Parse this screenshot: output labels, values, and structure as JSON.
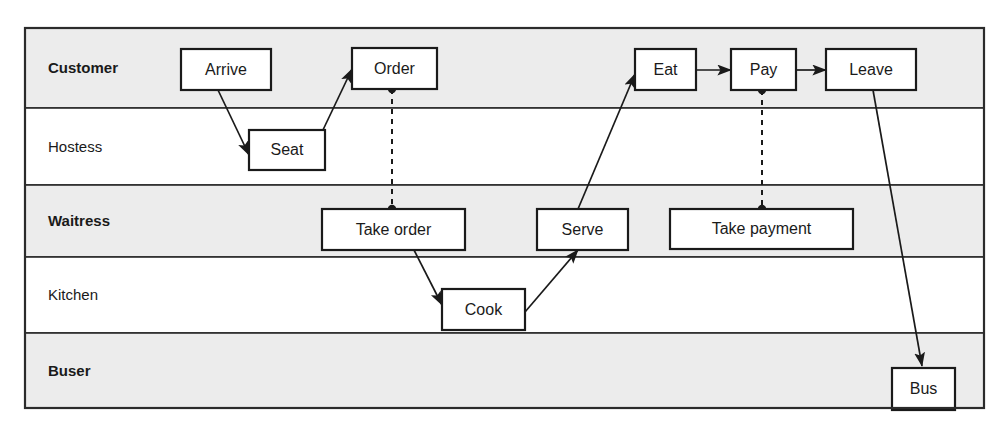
{
  "diagram": {
    "type": "swimlane-flowchart",
    "colors": {
      "lane_shaded": "#ececec",
      "lane_plain": "#ffffff",
      "border": "#2b2b2b",
      "node_fill": "#ffffff",
      "line": "#1a1a1a"
    },
    "frame": {
      "x": 25,
      "y": 28,
      "width": 959,
      "height": 380
    },
    "lanes": [
      {
        "id": "customer",
        "label": "Customer",
        "bold": true,
        "shaded": true,
        "y": 28,
        "height": 80
      },
      {
        "id": "hostess",
        "label": "Hostess",
        "bold": false,
        "shaded": false,
        "y": 108,
        "height": 77
      },
      {
        "id": "waitress",
        "label": "Waitress",
        "bold": true,
        "shaded": true,
        "y": 185,
        "height": 72
      },
      {
        "id": "kitchen",
        "label": "Kitchen",
        "bold": false,
        "shaded": false,
        "y": 257,
        "height": 76
      },
      {
        "id": "buser",
        "label": "Buser",
        "bold": true,
        "shaded": true,
        "y": 333,
        "height": 75
      }
    ],
    "lane_label_x": 48,
    "nodes": [
      {
        "id": "arrive",
        "label": "Arrive",
        "lane": "customer",
        "x": 181,
        "y": 49,
        "width": 90,
        "height": 41
      },
      {
        "id": "order",
        "label": "Order",
        "lane": "customer",
        "x": 352,
        "y": 48,
        "width": 85,
        "height": 41
      },
      {
        "id": "eat",
        "label": "Eat",
        "lane": "customer",
        "x": 635,
        "y": 49,
        "width": 61,
        "height": 41
      },
      {
        "id": "pay",
        "label": "Pay",
        "lane": "customer",
        "x": 731,
        "y": 49,
        "width": 65,
        "height": 41
      },
      {
        "id": "leave",
        "label": "Leave",
        "lane": "customer",
        "x": 826,
        "y": 49,
        "width": 90,
        "height": 41
      },
      {
        "id": "seat",
        "label": "Seat",
        "lane": "hostess",
        "x": 249,
        "y": 130,
        "width": 76,
        "height": 40
      },
      {
        "id": "take-order",
        "label": "Take order",
        "lane": "waitress",
        "x": 322,
        "y": 209,
        "width": 143,
        "height": 41
      },
      {
        "id": "serve",
        "label": "Serve",
        "lane": "waitress",
        "x": 537,
        "y": 209,
        "width": 91,
        "height": 41
      },
      {
        "id": "take-payment",
        "label": "Take payment",
        "lane": "waitress",
        "x": 670,
        "y": 209,
        "width": 183,
        "height": 40
      },
      {
        "id": "cook",
        "label": "Cook",
        "lane": "kitchen",
        "x": 442,
        "y": 289,
        "width": 83,
        "height": 41
      },
      {
        "id": "bus",
        "label": "Bus",
        "lane": "buser",
        "x": 892,
        "y": 368,
        "width": 63,
        "height": 42
      }
    ],
    "flows": [
      {
        "id": "arrive-to-seat",
        "from": "arrive",
        "to": "seat",
        "style": "solid",
        "arrow": true,
        "points": "218,90 249,155"
      },
      {
        "id": "seat-to-order",
        "from": "seat",
        "to": "order",
        "style": "solid",
        "arrow": true,
        "points": "322,132 352,69"
      },
      {
        "id": "eat-to-pay",
        "from": "eat",
        "to": "pay",
        "style": "solid",
        "arrow": true,
        "points": "696,70 731,70"
      },
      {
        "id": "pay-to-leave",
        "from": "pay",
        "to": "leave",
        "style": "solid",
        "arrow": true,
        "points": "796,70 826,70"
      },
      {
        "id": "take-order-to-cook",
        "from": "take-order",
        "to": "cook",
        "style": "solid",
        "arrow": true,
        "points": "414,250 442,305"
      },
      {
        "id": "cook-to-serve",
        "from": "cook",
        "to": "serve",
        "style": "solid",
        "arrow": true,
        "points": "525,312 578,250"
      },
      {
        "id": "serve-to-eat",
        "from": "serve",
        "to": "eat",
        "style": "solid",
        "arrow": true,
        "points": "578,209 635,74"
      },
      {
        "id": "leave-to-bus",
        "from": "leave",
        "to": "bus",
        "style": "solid",
        "arrow": true,
        "points": "873,90 922,366"
      }
    ],
    "dependencies": [
      {
        "id": "order-take-order",
        "from": "order",
        "to": "take-order",
        "style": "dashed",
        "x": 392,
        "y1": 89,
        "y2": 209
      },
      {
        "id": "pay-take-payment",
        "from": "pay",
        "to": "take-payment",
        "style": "dashed",
        "x": 762,
        "y1": 90,
        "y2": 209
      }
    ]
  }
}
